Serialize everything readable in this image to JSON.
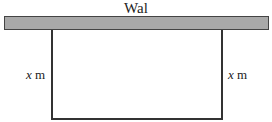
{
  "diagram": {
    "wall_label": "Wal",
    "left_side": {
      "var": "x",
      "unit": "m"
    },
    "right_side": {
      "var": "x",
      "unit": "m"
    }
  }
}
